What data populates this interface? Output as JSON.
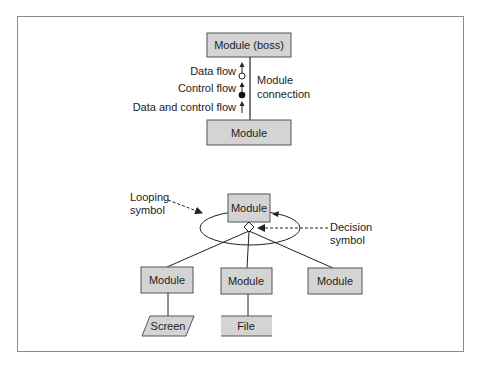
{
  "top_diagram": {
    "boss_module": "Module (boss)",
    "sub_module": "Module",
    "legend": {
      "data_flow": "Data flow",
      "control_flow": "Control flow",
      "data_and_control_flow": "Data and control flow"
    },
    "connection_label_line1": "Module",
    "connection_label_line2": "connection"
  },
  "bottom_diagram": {
    "parent_module": "Module",
    "looping_label_line1": "Looping",
    "looping_label_line2": "symbol",
    "decision_label_line1": "Decision",
    "decision_label_line2": "symbol",
    "children": [
      {
        "label": "Module"
      },
      {
        "label": "Module"
      },
      {
        "label": "Module"
      }
    ],
    "screen_label": "Screen",
    "file_label": "File"
  },
  "colors": {
    "box_fill": "#d4d4d4",
    "stroke": "#555555",
    "frame": "#8a8a8a"
  }
}
